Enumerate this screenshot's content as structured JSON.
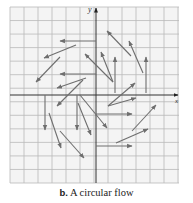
{
  "figure": {
    "caption_label": "b.",
    "caption_text": " A circular flow",
    "x_axis_label": "x",
    "y_axis_label": "y",
    "colors": {
      "grid": "#b9b9b9",
      "axis": "#333333",
      "arrow": "#6e6e6e",
      "background": "#f4f4f4"
    },
    "grid": {
      "left": 10,
      "top": 7,
      "right": 179,
      "bottom": 183,
      "cell": 14,
      "origin_x": 96,
      "origin_y": 95
    },
    "vectors": [
      {
        "x1": 131,
        "y1": 56,
        "x2": 107,
        "y2": 31
      },
      {
        "x1": 143,
        "y1": 73,
        "x2": 129,
        "y2": 41
      },
      {
        "x1": 115,
        "y1": 93,
        "x2": 115,
        "y2": 57
      },
      {
        "x1": 146,
        "y1": 93,
        "x2": 146,
        "y2": 57
      },
      {
        "x1": 113,
        "y1": 82,
        "x2": 101,
        "y2": 52
      },
      {
        "x1": 113,
        "y1": 82,
        "x2": 85,
        "y2": 54
      },
      {
        "x1": 96,
        "y1": 41,
        "x2": 60,
        "y2": 41
      },
      {
        "x1": 76,
        "y1": 45,
        "x2": 44,
        "y2": 58
      },
      {
        "x1": 60,
        "y1": 57,
        "x2": 36,
        "y2": 82
      },
      {
        "x1": 96,
        "y1": 74,
        "x2": 60,
        "y2": 74
      },
      {
        "x1": 86,
        "y1": 78,
        "x2": 57,
        "y2": 88
      },
      {
        "x1": 83,
        "y1": 80,
        "x2": 57,
        "y2": 106
      },
      {
        "x1": 45,
        "y1": 95,
        "x2": 45,
        "y2": 130
      },
      {
        "x1": 77,
        "y1": 95,
        "x2": 77,
        "y2": 130
      },
      {
        "x1": 49,
        "y1": 113,
        "x2": 61,
        "y2": 148
      },
      {
        "x1": 60,
        "y1": 131,
        "x2": 84,
        "y2": 158
      },
      {
        "x1": 78,
        "y1": 103,
        "x2": 91,
        "y2": 135
      },
      {
        "x1": 80,
        "y1": 95,
        "x2": 107,
        "y2": 128
      },
      {
        "x1": 108,
        "y1": 106,
        "x2": 135,
        "y2": 83
      },
      {
        "x1": 108,
        "y1": 106,
        "x2": 136,
        "y2": 98
      },
      {
        "x1": 96,
        "y1": 114,
        "x2": 132,
        "y2": 114
      },
      {
        "x1": 132,
        "y1": 131,
        "x2": 156,
        "y2": 105
      },
      {
        "x1": 116,
        "y1": 143,
        "x2": 148,
        "y2": 129
      },
      {
        "x1": 96,
        "y1": 146,
        "x2": 132,
        "y2": 146
      }
    ]
  }
}
